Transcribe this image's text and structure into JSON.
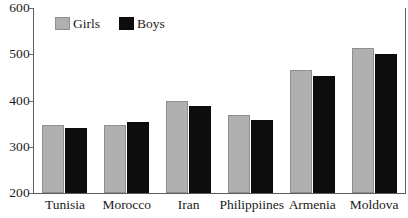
{
  "chart_data": {
    "type": "bar",
    "title": "",
    "subtitle": "",
    "xlabel": "",
    "ylabel": "",
    "categories": [
      "Tunisia",
      "Morocco",
      "Iran",
      "Philippiines",
      "Armenia",
      "Moldova"
    ],
    "series": [
      {
        "name": "Girls",
        "color": "#b0b0b0",
        "values": [
          346,
          348,
          398,
          368,
          466,
          514
        ]
      },
      {
        "name": "Boys",
        "color": "#0d0d0d",
        "values": [
          341,
          354,
          389,
          357,
          452,
          501
        ]
      }
    ],
    "ylim": [
      200,
      600
    ],
    "ytick_values": [
      200,
      300,
      400,
      500,
      600
    ],
    "ytick_labels": [
      "200",
      "300",
      "400",
      "500",
      "600"
    ],
    "grid": false,
    "legend_position": "top-left",
    "legend_entries": [
      "Girls",
      "Boys"
    ],
    "axis_color": "#5c5c5c",
    "background_color": "#ffffff"
  }
}
